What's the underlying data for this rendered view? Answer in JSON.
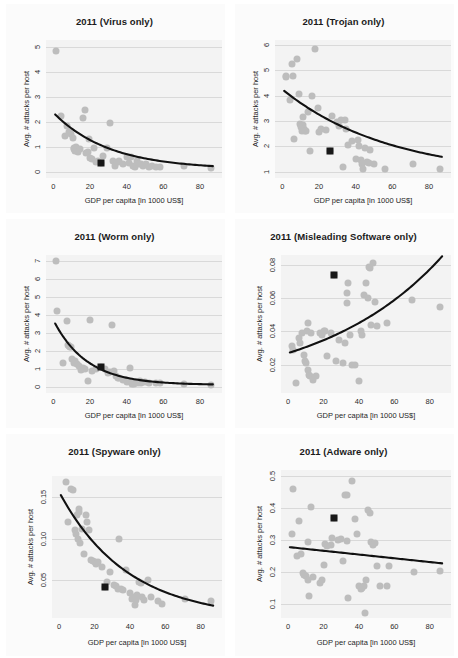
{
  "figure": {
    "layout": {
      "rows": 3,
      "cols": 2
    },
    "shared": {
      "xlabel": "GDP per capita [in 1000 US$]",
      "ylabel": "Avg. # attacks per host",
      "xticks": [
        0,
        20,
        40,
        60,
        80
      ],
      "xlim": [
        -4,
        92
      ],
      "point_color": "#bdbdbd",
      "marker_color": "#181818",
      "fit_color": "#111111",
      "grid_color": "#d9d9d9",
      "plot_bg": "#f3f3f3"
    }
  },
  "chart_data": [
    {
      "type": "scatter",
      "panel": 1,
      "title": "2011 (Virus only)",
      "xlabel": "GDP per capita [in 1000 US$]",
      "ylabel": "Avg. # attacks per host",
      "xticks": [
        0,
        20,
        40,
        60,
        80
      ],
      "yticks": [
        0,
        1,
        2,
        3,
        4,
        5
      ],
      "xlim": [
        -4,
        92
      ],
      "ylim": [
        -0.25,
        5.3
      ],
      "grid": true,
      "legend": "none",
      "x": [
        1.5,
        4.0,
        6.5,
        7.5,
        8.5,
        9.5,
        10.5,
        11.0,
        11.5,
        12.0,
        12.5,
        13.5,
        14.5,
        16.0,
        17.0,
        18.0,
        19.0,
        19.5,
        20.0,
        21.0,
        22.0,
        23.0,
        24.5,
        26.0,
        27.0,
        29.0,
        31.0,
        32.5,
        33.5,
        35.0,
        36.0,
        38.0,
        40.0,
        41.0,
        42.5,
        43.5,
        44.5,
        45.5,
        46.5,
        48.0,
        49.0,
        50.5,
        52.0,
        54.0,
        56.0,
        58.0,
        71.0,
        86.0
      ],
      "y": [
        4.85,
        2.25,
        1.45,
        1.85,
        1.6,
        1.5,
        1.35,
        0.95,
        0.9,
        0.85,
        1.0,
        0.8,
        0.9,
        2.15,
        2.5,
        0.75,
        0.8,
        1.3,
        0.55,
        0.5,
        0.95,
        0.4,
        0.45,
        0.35,
        0.65,
        0.95,
        1.95,
        0.45,
        0.25,
        0.4,
        0.45,
        0.3,
        0.6,
        0.35,
        0.6,
        0.25,
        0.2,
        0.45,
        0.3,
        0.3,
        0.25,
        0.3,
        0.2,
        0.25,
        0.2,
        0.2,
        0.25,
        0.15
      ],
      "highlight_point": {
        "x": 26.0,
        "y": 0.35,
        "shape": "square",
        "color": "#181818"
      },
      "fit": {
        "kind": "exponential_decay",
        "a": 2.28,
        "b": 0.033,
        "c": 0.1,
        "x_from": 1.0,
        "x_to": 87.0,
        "trend": "decreasing"
      }
    },
    {
      "type": "scatter",
      "panel": 2,
      "title": "2011 (Trojan only)",
      "xlabel": "GDP per capita [in 1000 US$]",
      "ylabel": "Avg. # attacks per host",
      "xticks": [
        0,
        20,
        40,
        60,
        80
      ],
      "yticks": [
        1,
        2,
        3,
        4,
        5,
        6
      ],
      "xlim": [
        -4,
        92
      ],
      "ylim": [
        0.75,
        6.2
      ],
      "grid": true,
      "legend": "none",
      "x": [
        2.0,
        2.2,
        4.0,
        5.0,
        6.0,
        6.5,
        8.0,
        9.0,
        9.5,
        10.0,
        10.5,
        11.0,
        11.5,
        12.0,
        12.5,
        13.0,
        14.0,
        15.0,
        16.0,
        18.0,
        19.5,
        20.0,
        21.0,
        24.0,
        26.0,
        27.0,
        30.0,
        31.0,
        32.0,
        33.0,
        34.0,
        34.5,
        36.0,
        38.0,
        40.0,
        41.0,
        42.0,
        43.0,
        43.5,
        44.0,
        45.0,
        46.0,
        47.0,
        48.0,
        50.0,
        56.0,
        71.0,
        86.0
      ],
      "y": [
        4.75,
        4.78,
        3.85,
        5.25,
        4.78,
        2.3,
        5.45,
        4.05,
        2.9,
        2.75,
        2.6,
        3.15,
        2.85,
        2.7,
        2.6,
        2.6,
        3.35,
        1.8,
        4.0,
        5.85,
        3.5,
        2.55,
        2.7,
        2.65,
        1.8,
        3.2,
        2.95,
        2.8,
        3.05,
        1.2,
        3.05,
        2.7,
        2.05,
        2.2,
        1.5,
        2.25,
        2.0,
        1.45,
        1.3,
        1.1,
        1.95,
        1.4,
        1.35,
        1.85,
        1.3,
        1.1,
        1.3,
        1.1
      ],
      "highlight_point": {
        "x": 26.0,
        "y": 1.8,
        "shape": "square",
        "color": "#181818"
      },
      "fit": {
        "kind": "exponential_decay",
        "a": 3.45,
        "b": 0.017,
        "c": 0.8,
        "x_from": 1.0,
        "x_to": 87.0,
        "trend": "decreasing"
      }
    },
    {
      "type": "scatter",
      "panel": 3,
      "title": "2011 (Worm only)",
      "xlabel": "GDP per capita [in 1000 US$]",
      "ylabel": "Avg. # attacks per host",
      "xticks": [
        0,
        20,
        40,
        60,
        80
      ],
      "yticks": [
        0,
        1,
        2,
        3,
        4,
        5,
        6,
        7
      ],
      "xlim": [
        -4,
        92
      ],
      "ylim": [
        -0.35,
        7.35
      ],
      "grid": true,
      "legend": "none",
      "x": [
        1.5,
        2.0,
        5.0,
        7.5,
        8.0,
        8.5,
        9.0,
        9.5,
        10.0,
        11.0,
        12.0,
        13.0,
        14.0,
        15.0,
        16.0,
        17.0,
        19.0,
        20.0,
        21.0,
        23.0,
        26.0,
        28.0,
        30.0,
        31.0,
        32.0,
        33.0,
        34.0,
        35.0,
        36.0,
        38.0,
        40.0,
        41.0,
        42.0,
        43.0,
        43.5,
        44.0,
        45.0,
        46.0,
        47.0,
        48.0,
        50.0,
        52.0,
        56.0,
        58.0,
        71.0,
        86.0
      ],
      "y": [
        7.0,
        4.2,
        1.3,
        3.65,
        2.35,
        2.3,
        2.2,
        2.2,
        1.55,
        1.3,
        1.45,
        1.25,
        1.15,
        0.95,
        1.05,
        1.0,
        0.3,
        3.7,
        0.85,
        1.0,
        1.1,
        1.0,
        0.75,
        0.8,
        3.45,
        0.85,
        0.6,
        0.5,
        0.5,
        0.35,
        0.25,
        0.3,
        1.05,
        0.15,
        0.2,
        0.15,
        0.25,
        0.2,
        0.3,
        0.2,
        0.25,
        0.2,
        0.2,
        0.2,
        0.15,
        0.1
      ],
      "highlight_point": {
        "x": 26.0,
        "y": 1.1,
        "shape": "square",
        "color": "#181818"
      },
      "fit": {
        "kind": "exponential_decay",
        "a": 3.62,
        "b": 0.055,
        "c": 0.1,
        "x_from": 1.0,
        "x_to": 87.0,
        "trend": "decreasing"
      }
    },
    {
      "type": "scatter",
      "panel": 4,
      "title": "2011 (Misleading Software only)",
      "xlabel": "GDP per capita [in 1000 US$]",
      "ylabel": "Avg. # attacks per host",
      "xticks": [
        0,
        20,
        40,
        60,
        80
      ],
      "yticks": [
        0.02,
        0.04,
        0.06,
        0.08
      ],
      "ytick_labels": [
        "0.02",
        "0.04",
        "0.06",
        "0.08"
      ],
      "xlim": [
        -4,
        92
      ],
      "ylim": [
        0.003,
        0.086
      ],
      "grid": true,
      "legend": "none",
      "x": [
        2.0,
        2.5,
        4.5,
        6.0,
        7.0,
        8.0,
        9.0,
        9.5,
        10.0,
        10.5,
        11.0,
        11.5,
        12.0,
        12.5,
        13.0,
        14.0,
        16.0,
        18.0,
        19.0,
        20.0,
        21.0,
        22.0,
        24.0,
        26.0,
        27.0,
        29.0,
        31.0,
        32.0,
        33.0,
        33.5,
        34.0,
        35.0,
        36.0,
        38.0,
        40.0,
        41.0,
        42.0,
        43.0,
        44.0,
        45.0,
        45.5,
        46.0,
        47.0,
        48.0,
        49.0,
        50.0,
        56.0,
        70.0,
        86.0
      ],
      "y": [
        0.031,
        0.029,
        0.009,
        0.036,
        0.033,
        0.039,
        0.026,
        0.022,
        0.021,
        0.04,
        0.045,
        0.017,
        0.014,
        0.013,
        0.039,
        0.011,
        0.013,
        0.039,
        0.038,
        0.04,
        0.04,
        0.025,
        0.039,
        0.074,
        0.022,
        0.035,
        0.021,
        0.033,
        0.057,
        0.063,
        0.069,
        0.038,
        0.02,
        0.02,
        0.01,
        0.04,
        0.038,
        0.062,
        0.069,
        0.06,
        0.079,
        0.078,
        0.044,
        0.081,
        0.058,
        0.043,
        0.045,
        0.059,
        0.055
      ],
      "highlight_point": {
        "x": 26.0,
        "y": 0.074,
        "shape": "square",
        "color": "#181818"
      },
      "fit": {
        "kind": "exponential_growth",
        "a": 0.023,
        "b": 0.0145,
        "c": 0.004,
        "x_from": 1.0,
        "x_to": 87.0,
        "trend": "increasing"
      }
    },
    {
      "type": "scatter",
      "panel": 5,
      "title": "2011 (Spyware only)",
      "xlabel": "GDP per capita [in 1000 US$]",
      "ylabel": "Avg. # attacks per host",
      "xticks": [
        0,
        20,
        40,
        60,
        80
      ],
      "yticks": [
        0.05,
        0.1,
        0.15
      ],
      "ytick_labels": [
        "0.05",
        "0.10",
        "0.15"
      ],
      "xlim": [
        -4,
        92
      ],
      "ylim": [
        0.005,
        0.175
      ],
      "grid": true,
      "legend": "none",
      "x": [
        4.0,
        5.0,
        7.0,
        8.0,
        9.0,
        9.5,
        10.0,
        10.5,
        11.0,
        11.5,
        12.0,
        13.0,
        14.0,
        15.0,
        16.0,
        17.0,
        18.0,
        19.0,
        20.0,
        21.0,
        22.0,
        24.0,
        26.0,
        27.0,
        29.0,
        31.0,
        32.0,
        33.0,
        34.0,
        35.0,
        36.0,
        38.0,
        40.0,
        41.0,
        42.0,
        43.0,
        43.5,
        44.0,
        45.0,
        46.0,
        47.0,
        48.0,
        50.0,
        52.0,
        56.0,
        58.0,
        71.0,
        86.0
      ],
      "y": [
        0.168,
        0.12,
        0.16,
        0.158,
        0.11,
        0.105,
        0.128,
        0.1,
        0.132,
        0.135,
        0.095,
        0.112,
        0.082,
        0.128,
        0.12,
        0.11,
        0.075,
        0.073,
        0.072,
        0.07,
        0.072,
        0.066,
        0.042,
        0.048,
        0.06,
        0.045,
        0.043,
        0.04,
        0.1,
        0.04,
        0.038,
        0.062,
        0.035,
        0.028,
        0.03,
        0.02,
        0.027,
        0.032,
        0.048,
        0.047,
        0.03,
        0.027,
        0.05,
        0.03,
        0.025,
        0.022,
        0.028,
        0.025
      ],
      "highlight_point": {
        "x": 26.0,
        "y": 0.042,
        "shape": "square",
        "color": "#181818"
      },
      "fit": {
        "kind": "exponential_decay",
        "a": 0.152,
        "b": 0.026,
        "c": 0.004,
        "x_from": 1.0,
        "x_to": 87.0,
        "trend": "decreasing"
      }
    },
    {
      "type": "scatter",
      "panel": 6,
      "title": "2011 (Adware only)",
      "xlabel": "GDP per capita [in 1000 US$]",
      "ylabel": "Avg. # attacks per host",
      "xticks": [
        0,
        20,
        40,
        60,
        80
      ],
      "yticks": [
        0.1,
        0.2,
        0.3,
        0.4,
        0.5
      ],
      "ytick_labels": [
        "0.1",
        "0.2",
        "0.3",
        "0.4",
        "0.5"
      ],
      "xlim": [
        -4,
        92
      ],
      "ylim": [
        0.055,
        0.52
      ],
      "grid": true,
      "legend": "none",
      "x": [
        2.0,
        3.0,
        5.0,
        6.0,
        7.5,
        8.5,
        9.0,
        10.0,
        11.0,
        11.5,
        12.0,
        13.0,
        14.0,
        18.0,
        19.0,
        20.0,
        21.0,
        22.0,
        24.0,
        25.0,
        26.0,
        28.0,
        30.0,
        31.0,
        32.0,
        33.0,
        33.5,
        34.0,
        36.0,
        38.0,
        39.0,
        40.0,
        41.0,
        42.0,
        43.0,
        43.5,
        44.0,
        45.0,
        46.0,
        47.0,
        48.0,
        49.0,
        50.0,
        52.0,
        56.0,
        57.0,
        71.0,
        86.0
      ],
      "y": [
        0.32,
        0.46,
        0.25,
        0.36,
        0.255,
        0.195,
        0.19,
        0.188,
        0.295,
        0.175,
        0.125,
        0.405,
        0.185,
        0.165,
        0.175,
        0.22,
        0.288,
        0.282,
        0.283,
        0.305,
        0.37,
        0.3,
        0.302,
        0.235,
        0.44,
        0.44,
        0.298,
        0.118,
        0.485,
        0.365,
        0.32,
        0.155,
        0.145,
        0.15,
        0.155,
        0.07,
        0.175,
        0.393,
        0.385,
        0.295,
        0.285,
        0.29,
        0.218,
        0.155,
        0.155,
        0.218,
        0.2,
        0.203
      ],
      "highlight_point": {
        "x": 26.0,
        "y": 0.37,
        "shape": "square",
        "color": "#181818"
      },
      "fit": {
        "kind": "linear",
        "intercept": 0.278,
        "slope": -0.00059,
        "x_from": 1.0,
        "x_to": 87.0,
        "trend": "slightly decreasing"
      }
    }
  ]
}
